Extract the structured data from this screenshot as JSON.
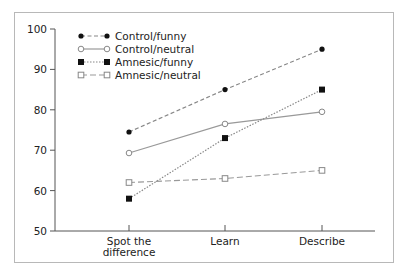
{
  "chart_data": {
    "type": "line",
    "title": "",
    "xlabel": "",
    "ylabel": "",
    "categories": [
      "Spot the difference",
      "Learn",
      "Describe"
    ],
    "category_lines": [
      [
        "Spot the",
        "difference"
      ],
      [
        "Learn"
      ],
      [
        "Describe"
      ]
    ],
    "ylim": [
      50,
      100
    ],
    "yticks": [
      50,
      60,
      70,
      80,
      90,
      100
    ],
    "grid": false,
    "legend_position": "top-left inside",
    "series": [
      {
        "name": "Control/funny",
        "values": [
          74.5,
          85,
          95
        ],
        "marker": "filled-circle",
        "line": "dashed",
        "color": "#888888"
      },
      {
        "name": "Control/neutral",
        "values": [
          69.3,
          76.5,
          79.5
        ],
        "marker": "open-circle",
        "line": "solid",
        "color": "#999999"
      },
      {
        "name": "Amnesic/funny",
        "values": [
          58,
          73,
          85
        ],
        "marker": "filled-square",
        "line": "dotted",
        "color": "#888888"
      },
      {
        "name": "Amnesic/neutral",
        "values": [
          62,
          63,
          65
        ],
        "marker": "open-square",
        "line": "long-dash",
        "color": "#999999"
      }
    ]
  }
}
